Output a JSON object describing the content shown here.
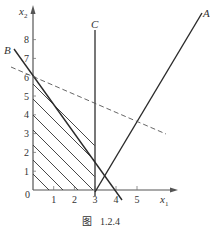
{
  "figure": {
    "caption": "图 1.2.4",
    "caption_prefix": "图",
    "caption_number": "1.2.4",
    "axes": {
      "x_label": "x",
      "x_sub": "1",
      "y_label": "x",
      "y_sub": "2",
      "origin_label": "0",
      "x_ticks": [
        "1",
        "2",
        "3",
        "4",
        "5"
      ],
      "y_ticks": [
        "1",
        "2",
        "3",
        "4",
        "5",
        "6",
        "7",
        "8"
      ]
    },
    "lines": [
      {
        "name": "A",
        "style": "solid"
      },
      {
        "name": "B",
        "style": "solid"
      },
      {
        "name": "C",
        "style": "solid"
      },
      {
        "name": "objective",
        "style": "dashed"
      }
    ],
    "labels": {
      "A": "A",
      "B": "B",
      "C": "C"
    },
    "colors": {
      "line": "#2a2a2a",
      "axis": "#555555",
      "hatch": "#333333"
    }
  }
}
